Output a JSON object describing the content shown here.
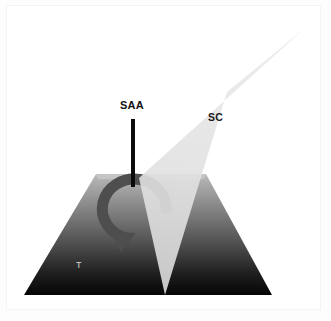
{
  "figure": {
    "kind": "schematic-diagram",
    "background_color": "#ffffff",
    "frame_border_color": "#f4f4f4",
    "labels": {
      "saa": "SAA",
      "sc": "SC",
      "t": "T"
    },
    "label_colors": {
      "saa": "#111111",
      "sc": "#1a1a1a",
      "t": "#d8d8d8"
    },
    "shapes": {
      "trapezoid": {
        "name": "T",
        "description": "gradient trapezoid body",
        "points": "24,295 96,174 206,174 272,295",
        "gradient_top_color": "#b4b4b4",
        "gradient_mid_color": "#6b6b6b",
        "gradient_bottom_color": "#050505"
      },
      "beam": {
        "name": "SC",
        "description": "translucent light grey beam crossing the trapezoid",
        "points": "305,28 227,92 165,295 139,178",
        "fill_color": "#e4e4e4",
        "opacity": 0.88
      },
      "axis_line": {
        "name": "SAA",
        "description": "vertical rotation axis line",
        "x": 133,
        "y_top": 119,
        "y_bottom": 187,
        "stroke_color": "#0a0a0a",
        "stroke_width": 4
      },
      "rotation_arrow": {
        "name": "rotation arrow",
        "description": "counter-clockwise curved arrow around the axis",
        "stroke_color": "#4f4f4f",
        "stroke_width": 11,
        "arrow_tip": "118,247"
      }
    }
  }
}
